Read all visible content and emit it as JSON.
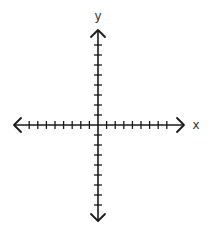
{
  "diagram": {
    "type": "coordinate-plane",
    "title": "",
    "x_axis": {
      "label": "x",
      "ticks_negative": 8,
      "ticks_positive": 8,
      "arrows": "both"
    },
    "y_axis": {
      "label": "y",
      "ticks_positive": 8,
      "ticks_negative": 8,
      "arrows": "both"
    },
    "colors": {
      "axis": "#1a1a1a",
      "label": "#333333",
      "background": "#ffffff"
    }
  }
}
